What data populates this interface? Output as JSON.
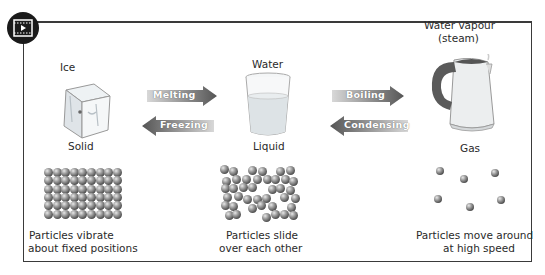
{
  "badge": {
    "icon": "video-play-icon"
  },
  "states": [
    {
      "name": "Ice",
      "state": "Solid",
      "description_line1": "Particles vibrate",
      "description_line2": "about  fixed positions"
    },
    {
      "name": "Water",
      "state": "Liquid",
      "description_line1": "Particles slide",
      "description_line2": "over each other"
    },
    {
      "name_line1": "Water vapour",
      "name_line2": "(steam)",
      "state": "Gas",
      "description_line1": "Particles move around",
      "description_line2": "at high speed"
    }
  ],
  "transitions": {
    "melting": "Melting",
    "freezing": "Freezing",
    "boiling": "Boiling",
    "condensing": "Condensing"
  },
  "colors": {
    "frame": "#3a3a3a",
    "arrow_dark": "#555555",
    "arrow_light": "#d0d0d0"
  }
}
